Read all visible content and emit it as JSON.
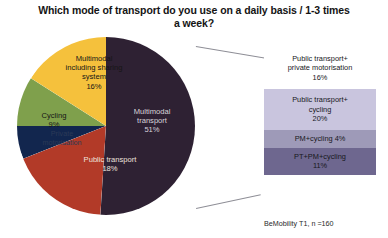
{
  "chart_data": {
    "type": "pie",
    "title": "Which mode of transport do you use on a daily basis / 1-3 times a week?",
    "categories": [
      "Multimodal transport",
      "Public transport",
      "Private motorisation",
      "Cycling",
      "Multimodal including sharing system"
    ],
    "values": [
      51,
      18,
      6,
      9,
      16
    ],
    "unit": "%",
    "legend": "none",
    "grid": false,
    "slices": [
      {
        "label": "Multimodal transport",
        "label_line1": "Multimodal",
        "label_line2": "transport",
        "value": 51,
        "value_text": "51%",
        "color": "#2e2133",
        "start_deg": 0,
        "end_deg": 183.6,
        "text_color": "#d9d4da"
      },
      {
        "label": "Public transport",
        "label_line1": "Public transport",
        "label_line2": "",
        "value": 18,
        "value_text": "18%",
        "color": "#b23a28",
        "start_deg": 183.6,
        "end_deg": 248.4,
        "text_color": "#efe2dc"
      },
      {
        "label": "Private motorisation",
        "label_line1": "Private",
        "label_line2": "motorisation",
        "value": 6,
        "value_text": "6%",
        "color": "#12264e",
        "start_deg": 248.4,
        "end_deg": 270.0,
        "text_color": "#2b3a57"
      },
      {
        "label": "Cycling",
        "label_line1": "Cycling",
        "label_line2": "",
        "value": 9,
        "value_text": "9%",
        "color": "#7fa04c",
        "start_deg": 270.0,
        "end_deg": 302.4,
        "text_color": "#161616"
      },
      {
        "label": "Multimodal including sharing system",
        "label_line1": "Multimodal",
        "label_line2": "including sharing",
        "label_line3": "system",
        "value": 16,
        "value_text": "16%",
        "color": "#f5c13c",
        "start_deg": 302.4,
        "end_deg": 360.0,
        "text_color": "#161616"
      }
    ],
    "breakdown": {
      "of_slice": "Multimodal transport",
      "total": 51,
      "items": [
        {
          "label_line1": "Public transport+",
          "label_line2": "private motorisation",
          "value": 16,
          "value_text": "16%",
          "color": "#ffffff"
        },
        {
          "label_line1": "Public transport+",
          "label_line2": "cycling",
          "value": 20,
          "value_text": "20%",
          "color": "#c9c5de"
        },
        {
          "label_line1": "PM+cycling 4%",
          "label_line2": "",
          "value": 4,
          "value_text": "4%",
          "color": "#9e9ab8"
        },
        {
          "label_line1": "PT+PM+cycling",
          "label_line2": "",
          "value": 11,
          "value_text": "11%",
          "color": "#6e678f"
        }
      ]
    },
    "source_note": "BeMobility T1, n =160"
  }
}
